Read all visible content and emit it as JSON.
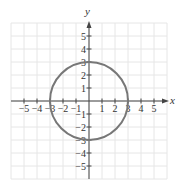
{
  "chart_data": {
    "type": "line",
    "title": "",
    "xlabel": "x",
    "ylabel": "y",
    "xlim": [
      -6,
      6
    ],
    "ylim": [
      -6,
      6
    ],
    "grid": true,
    "x_ticks": [
      -5,
      -4,
      -3,
      -2,
      -1,
      1,
      2,
      3,
      4,
      5
    ],
    "y_ticks": [
      -5,
      -4,
      -3,
      -2,
      -1,
      1,
      2,
      3,
      4,
      5
    ],
    "x_tick_labels": [
      "−5",
      "−4",
      "−3",
      "−2",
      "−1",
      "1",
      "2",
      "3",
      "4",
      "5"
    ],
    "y_tick_labels": [
      "−5",
      "−4",
      "−3",
      "−2",
      "−1",
      "1",
      "2",
      "3",
      "4",
      "5"
    ],
    "series": [
      {
        "name": "circle",
        "shape": "circle",
        "center": [
          0,
          0
        ],
        "radius": 3,
        "equation": "x^2 + y^2 = 9",
        "color": "#777777"
      }
    ],
    "legend": null
  },
  "layout": {
    "origin_px": [
      89,
      101
    ],
    "unit_px": 13,
    "grid_color": "#e6e6e6",
    "axis_color": "#444444",
    "curve_color": "#777777"
  },
  "labels": {
    "x_axis": "x",
    "y_axis": "y"
  }
}
